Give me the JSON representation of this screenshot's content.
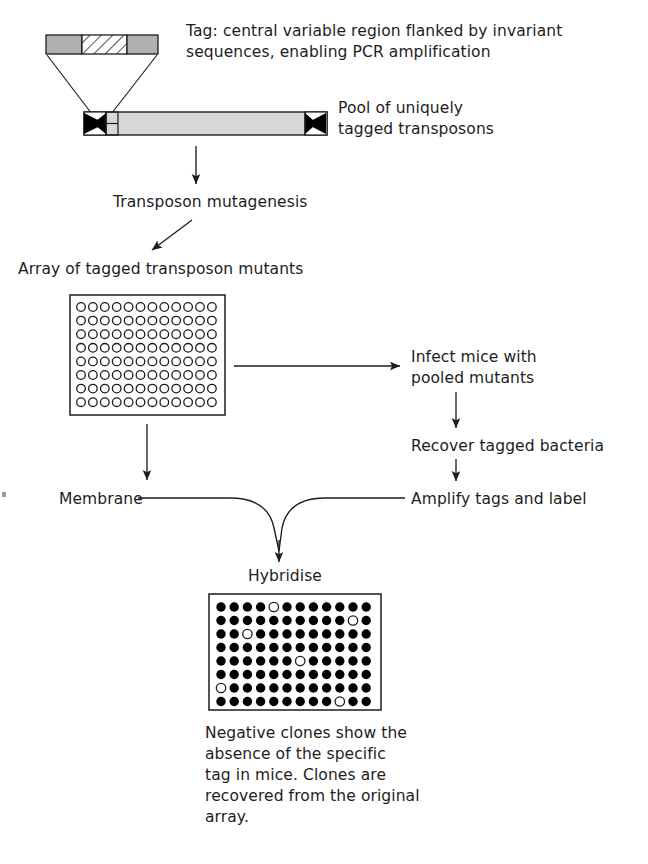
{
  "diagram": {
    "type": "flow-diagram"
  },
  "labels": {
    "tag_description": "Tag: central variable region flanked by invariant\nsequences, enabling PCR amplification",
    "transposon_pool": "Pool of uniquely\ntagged transposons",
    "transposon_mutagenesis": "Transposon mutagenesis",
    "array_of_mutants": "Array of tagged transposon mutants",
    "infect_mice": "Infect mice with\npooled mutants",
    "recover_bacteria": "Recover tagged bacteria",
    "membrane": "Membrane",
    "amplify_tags": "Amplify tags and label",
    "hybridise": "Hybridise",
    "negative_clones_caption": "Negative clones show the\nabsence of the specific\ntag in mice. Clones are\nrecovered from the original\narray."
  },
  "tag_construct": {
    "segments": [
      {
        "name": "invariant-left",
        "fill": "#b0b0b0"
      },
      {
        "name": "variable-region",
        "fill": "hatched"
      },
      {
        "name": "invariant-right",
        "fill": "#b0b0b0"
      }
    ]
  },
  "transposon_construct": {
    "body_fill": "#d8d8d8",
    "inverted_repeat_fill": "#000000",
    "ends": [
      "inverted-repeat-left",
      "inverted-repeat-right"
    ]
  },
  "chart_data": {
    "type": "heatmap",
    "arrays": [
      {
        "name": "master-array",
        "label": "Array of tagged transposon mutants",
        "rows": 8,
        "cols": 12,
        "marker": "open-circle",
        "values": [
          [
            0,
            0,
            0,
            0,
            0,
            0,
            0,
            0,
            0,
            0,
            0,
            0
          ],
          [
            0,
            0,
            0,
            0,
            0,
            0,
            0,
            0,
            0,
            0,
            0,
            0
          ],
          [
            0,
            0,
            0,
            0,
            0,
            0,
            0,
            0,
            0,
            0,
            0,
            0
          ],
          [
            0,
            0,
            0,
            0,
            0,
            0,
            0,
            0,
            0,
            0,
            0,
            0
          ],
          [
            0,
            0,
            0,
            0,
            0,
            0,
            0,
            0,
            0,
            0,
            0,
            0
          ],
          [
            0,
            0,
            0,
            0,
            0,
            0,
            0,
            0,
            0,
            0,
            0,
            0
          ],
          [
            0,
            0,
            0,
            0,
            0,
            0,
            0,
            0,
            0,
            0,
            0,
            0
          ],
          [
            0,
            0,
            0,
            0,
            0,
            0,
            0,
            0,
            0,
            0,
            0,
            0
          ]
        ]
      },
      {
        "name": "hybridised-array",
        "label": "Hybridise",
        "rows": 8,
        "cols": 12,
        "marker": "filled-circle",
        "legend": {
          "1": "positive clone (filled)",
          "0": "negative clone (open)"
        },
        "negative_positions": [
          {
            "row": 1,
            "col": 5
          },
          {
            "row": 2,
            "col": 11
          },
          {
            "row": 3,
            "col": 3
          },
          {
            "row": 5,
            "col": 7
          },
          {
            "row": 7,
            "col": 1
          },
          {
            "row": 8,
            "col": 10
          }
        ],
        "values": [
          [
            1,
            1,
            1,
            1,
            0,
            1,
            1,
            1,
            1,
            1,
            1,
            1
          ],
          [
            1,
            1,
            1,
            1,
            1,
            1,
            1,
            1,
            1,
            1,
            0,
            1
          ],
          [
            1,
            1,
            0,
            1,
            1,
            1,
            1,
            1,
            1,
            1,
            1,
            1
          ],
          [
            1,
            1,
            1,
            1,
            1,
            1,
            1,
            1,
            1,
            1,
            1,
            1
          ],
          [
            1,
            1,
            1,
            1,
            1,
            1,
            0,
            1,
            1,
            1,
            1,
            1
          ],
          [
            1,
            1,
            1,
            1,
            1,
            1,
            1,
            1,
            1,
            1,
            1,
            1
          ],
          [
            0,
            1,
            1,
            1,
            1,
            1,
            1,
            1,
            1,
            1,
            1,
            1
          ],
          [
            1,
            1,
            1,
            1,
            1,
            1,
            1,
            1,
            1,
            0,
            1,
            1
          ]
        ]
      }
    ]
  },
  "colors": {
    "ink": "#1d1d1d",
    "tag_gray": "#b0b0b0",
    "body_gray": "#d8d8d8",
    "dot_fill": "#000000"
  }
}
